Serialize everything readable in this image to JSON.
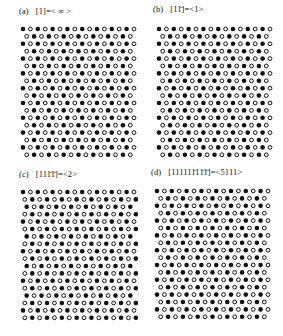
{
  "figure": {
    "type": "lattice-diagram-figure",
    "background": "#ffffff",
    "symbol_colors": {
      "filled": "#111111",
      "open_stroke": "#111111",
      "open_fill": "#ffffff"
    }
  },
  "panels": [
    {
      "id": "a",
      "index_label": "(a)",
      "notation": "[1]=< ∞ >",
      "bracket": "[1]",
      "equals": "=",
      "angle": "< ∞ >",
      "overbars": [],
      "description": "Flat interface, period 1, zero-slope terrace sequence"
    },
    {
      "id": "b",
      "index_label": "(b)",
      "notation": "[11̄]=<1>",
      "bracket": "[11̄]",
      "equals": "=",
      "angle": "<1>",
      "overbars": [
        2
      ],
      "description": "Alternating up-down step sequence, period 2"
    },
    {
      "id": "c",
      "index_label": "(c)",
      "notation": "[111̄1̄]=<2>",
      "bracket": "[111̄1̄]",
      "equals": "=",
      "angle": "<2>",
      "overbars": [
        3,
        4
      ],
      "description": "Two up two down sequence, period 4"
    },
    {
      "id": "d",
      "index_label": "(d)",
      "notation": "[111111̄11̄1̄]=<5111>",
      "bracket": "[111111̄11̄1̄]",
      "equals": "=",
      "angle": "<5111>",
      "overbars": [
        6,
        8,
        9
      ],
      "description": "Mixed sequence five up one down one up two down, period 9"
    }
  ],
  "chart_data": {
    "type": "scatter",
    "title": "",
    "xlabel": "",
    "ylabel": "",
    "grid": false,
    "legend": "none",
    "marker_types": [
      "filled-circle",
      "open-circle"
    ],
    "lattice": {
      "columns": 16,
      "rows": 18,
      "dx": 7.4,
      "dy": 7.4,
      "radius_filled": 2.3,
      "radius_open": 2.3,
      "open_stroke_width": 1.0
    },
    "panels": [
      {
        "id": "a",
        "row_shift_pattern": [
          0,
          0.5,
          1.0,
          1.5,
          2.0,
          2.5,
          3.0,
          3.5,
          4.0,
          4.5,
          5.0,
          5.5,
          6.0,
          6.5,
          7.0,
          7.5,
          8.0,
          8.5
        ],
        "fill_phase_pattern": [
          0,
          1,
          0,
          1,
          0,
          1,
          0,
          1,
          0,
          1,
          0,
          1,
          0,
          1,
          0,
          1,
          0,
          1
        ]
      },
      {
        "id": "b",
        "row_shift_pattern": [
          0,
          0.5,
          0,
          0.5,
          0,
          0.5,
          0,
          0.5,
          0,
          0.5,
          0,
          0.5,
          0,
          0.5,
          0,
          0.5,
          0,
          0.5
        ],
        "fill_phase_pattern": [
          0,
          1,
          0,
          1,
          0,
          1,
          0,
          1,
          0,
          1,
          0,
          1,
          0,
          1,
          0,
          1,
          0,
          1
        ]
      },
      {
        "id": "c",
        "row_shift_pattern": [
          0,
          0.25,
          0.5,
          0.25,
          0,
          0.25,
          0.5,
          0.25,
          0,
          0.25,
          0.5,
          0.25,
          0,
          0.25,
          0.5,
          0.25,
          0,
          0.25
        ],
        "fill_phase_pattern": [
          0,
          1,
          0,
          1,
          0,
          1,
          0,
          1,
          0,
          1,
          0,
          1,
          0,
          1,
          0,
          1,
          0,
          1
        ]
      },
      {
        "id": "d",
        "row_shift_pattern": [
          0,
          0.5,
          1.0,
          1.5,
          2.0,
          1.5,
          2.0,
          1.5,
          1.0,
          1.5,
          2.0,
          2.5,
          3.0,
          2.5,
          3.0,
          2.5,
          2.0,
          2.5
        ],
        "fill_phase_pattern": [
          0,
          1,
          0,
          1,
          0,
          1,
          0,
          1,
          0,
          1,
          0,
          1,
          0,
          1,
          0,
          1,
          0,
          1
        ]
      }
    ]
  }
}
